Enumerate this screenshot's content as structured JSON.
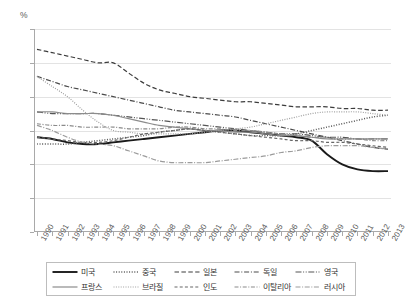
{
  "axis": {
    "unit_label": "%",
    "y_ticks": [
      0,
      2,
      4,
      6,
      8,
      10,
      12
    ],
    "x_ticks": [
      1990,
      1991,
      1992,
      1993,
      1994,
      1995,
      1996,
      1997,
      1998,
      1999,
      2000,
      2001,
      2002,
      2003,
      2004,
      2005,
      2006,
      2007,
      2008,
      2009,
      2010,
      2011,
      2012,
      2013
    ]
  },
  "legend": {
    "entries": [
      {
        "label": "미국",
        "dash": "none",
        "width": 1.9,
        "color": "#1a1a1a"
      },
      {
        "label": "중국",
        "dash": "1,1.6",
        "width": 1.5,
        "color": "#595959"
      },
      {
        "label": "일본",
        "dash": "4.5,2.4",
        "width": 1.2,
        "color": "#3c3c3c"
      },
      {
        "label": "독일",
        "dash": "5,1.8,1,1.8",
        "width": 1.2,
        "color": "#4a4a4a"
      },
      {
        "label": "영국",
        "dash": "6,1.6,1,1.6,1,1.6",
        "width": 1.2,
        "color": "#555555"
      },
      {
        "label": "프랑스",
        "dash": "none",
        "width": 1.2,
        "color": "#8c8c8c"
      },
      {
        "label": "브라질",
        "dash": "1,1.4",
        "width": 1.2,
        "color": "#a0a0a0"
      },
      {
        "label": "인도",
        "dash": "3,2.2",
        "width": 1.2,
        "color": "#666666"
      },
      {
        "label": "이탈리아",
        "dash": "4,1.6,1,1.6",
        "width": 1.2,
        "color": "#8a8a8a"
      },
      {
        "label": "러시아",
        "dash": "5,1.6,1,1.6",
        "width": 1.2,
        "color": "#9b9b9b"
      }
    ]
  },
  "chart_data": {
    "type": "line",
    "title": "",
    "xlabel": "",
    "ylabel": "%",
    "ylim": [
      0,
      12
    ],
    "ytick_step": 2,
    "grid": true,
    "legend_position": "bottom",
    "x": [
      1990,
      1991,
      1992,
      1993,
      1994,
      1995,
      1996,
      1997,
      1998,
      1999,
      2000,
      2001,
      2002,
      2003,
      2004,
      2005,
      2006,
      2007,
      2008,
      2009,
      2010,
      2011,
      2012,
      2013
    ],
    "series": [
      {
        "name": "미국",
        "values": [
          5.6,
          5.5,
          5.3,
          5.2,
          5.2,
          5.3,
          5.4,
          5.5,
          5.6,
          5.7,
          5.8,
          5.9,
          6.0,
          6.0,
          5.9,
          5.8,
          5.7,
          5.6,
          5.4,
          4.6,
          4.0,
          3.7,
          3.6,
          3.6
        ]
      },
      {
        "name": "중국",
        "values": [
          5.2,
          5.2,
          5.2,
          5.3,
          5.4,
          5.5,
          5.6,
          5.7,
          5.9,
          6.0,
          6.1,
          6.0,
          5.9,
          5.8,
          5.7,
          5.7,
          5.7,
          5.8,
          6.0,
          6.2,
          6.4,
          6.6,
          6.8,
          6.9
        ]
      },
      {
        "name": "일본",
        "values": [
          10.8,
          10.6,
          10.4,
          10.2,
          10.0,
          10.0,
          9.4,
          8.8,
          8.4,
          8.2,
          8.0,
          7.9,
          7.8,
          7.7,
          7.7,
          7.6,
          7.5,
          7.4,
          7.4,
          7.4,
          7.3,
          7.3,
          7.2,
          7.2
        ]
      },
      {
        "name": "독일",
        "values": [
          9.2,
          8.9,
          8.6,
          8.4,
          8.2,
          8.0,
          7.8,
          7.6,
          7.4,
          7.2,
          7.1,
          7.0,
          6.9,
          6.8,
          6.6,
          6.4,
          6.2,
          6.0,
          5.8,
          5.6,
          5.4,
          5.2,
          5.0,
          4.9
        ]
      },
      {
        "name": "영국",
        "values": [
          7.1,
          7.0,
          7.0,
          7.0,
          7.0,
          6.9,
          6.8,
          6.7,
          6.6,
          6.5,
          6.4,
          6.3,
          6.2,
          6.1,
          6.0,
          5.9,
          5.8,
          5.8,
          5.7,
          5.6,
          5.6,
          5.5,
          5.5,
          5.5
        ]
      },
      {
        "name": "프랑스",
        "values": [
          7.1,
          7.1,
          7.0,
          7.0,
          7.0,
          6.9,
          6.7,
          6.5,
          6.3,
          6.2,
          6.1,
          6.0,
          6.0,
          5.9,
          5.9,
          5.8,
          5.7,
          5.7,
          5.6,
          5.5,
          5.5,
          5.5,
          5.5,
          5.5
        ]
      },
      {
        "name": "브라질",
        "values": [
          9.2,
          8.6,
          8.0,
          7.2,
          6.5,
          6.0,
          5.9,
          5.8,
          5.8,
          5.8,
          5.8,
          5.9,
          6.0,
          6.1,
          6.2,
          6.4,
          6.6,
          6.8,
          7.0,
          7.1,
          7.1,
          7.1,
          7.0,
          6.9
        ]
      },
      {
        "name": "인도",
        "values": [
          5.6,
          5.5,
          5.4,
          5.3,
          5.3,
          5.4,
          5.6,
          5.8,
          5.9,
          6.0,
          6.1,
          6.0,
          5.9,
          5.8,
          5.7,
          5.6,
          5.5,
          5.4,
          5.4,
          5.3,
          5.3,
          5.2,
          5.1,
          5.0
        ]
      },
      {
        "name": "이탈리아",
        "values": [
          6.4,
          6.3,
          6.3,
          6.2,
          6.2,
          6.2,
          6.1,
          6.1,
          6.1,
          6.2,
          6.2,
          6.1,
          6.1,
          6.0,
          6.0,
          5.9,
          5.8,
          5.7,
          5.6,
          5.6,
          5.5,
          5.5,
          5.4,
          5.4
        ]
      },
      {
        "name": "러시아",
        "values": [
          6.3,
          6.0,
          5.6,
          5.3,
          5.2,
          5.1,
          4.8,
          4.5,
          4.2,
          4.1,
          4.1,
          4.1,
          4.2,
          4.3,
          4.4,
          4.5,
          4.7,
          4.8,
          5.0,
          5.1,
          5.1,
          5.1,
          5.0,
          4.9
        ]
      }
    ]
  }
}
